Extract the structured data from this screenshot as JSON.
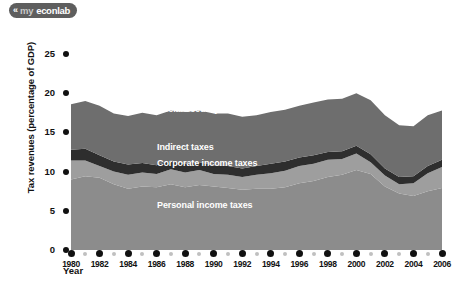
{
  "branding": {
    "logo_mark": "«",
    "logo_prefix": "my",
    "logo_suffix": "econlab"
  },
  "chart_data": {
    "type": "area",
    "title": "",
    "xlabel": "Year",
    "ylabel": "Tax revenues (percentage of GDP)",
    "xlim": [
      1980,
      2006
    ],
    "ylim": [
      0,
      25
    ],
    "yticks": [
      0,
      5,
      10,
      15,
      20,
      25
    ],
    "xticks": [
      1980,
      1982,
      1984,
      1986,
      1988,
      1990,
      1992,
      1994,
      1996,
      1998,
      2000,
      2002,
      2004,
      2006
    ],
    "grid": false,
    "legend_position": "inline-labels",
    "stacked": true,
    "x": [
      1980,
      1981,
      1982,
      1983,
      1984,
      1985,
      1986,
      1987,
      1988,
      1989,
      1990,
      1991,
      1992,
      1993,
      1994,
      1995,
      1996,
      1997,
      1998,
      1999,
      2000,
      2001,
      2002,
      2003,
      2004,
      2005,
      2006
    ],
    "series": [
      {
        "name": "Personal income taxes",
        "color": "#8c8c8c",
        "values": [
          9.0,
          9.4,
          9.2,
          8.4,
          7.8,
          8.1,
          8.0,
          8.4,
          8.0,
          8.3,
          8.1,
          7.9,
          7.7,
          7.8,
          7.8,
          8.0,
          8.5,
          8.8,
          9.3,
          9.6,
          10.2,
          9.7,
          8.1,
          7.2,
          6.9,
          7.5,
          7.9
        ]
      },
      {
        "name": "Corporate income taxes",
        "color": "#9e9e9e",
        "values": [
          2.4,
          2.0,
          1.5,
          1.6,
          1.8,
          1.8,
          1.7,
          1.9,
          1.9,
          1.9,
          1.6,
          1.7,
          1.6,
          1.8,
          2.0,
          2.1,
          2.2,
          2.2,
          2.2,
          2.0,
          2.1,
          1.5,
          1.4,
          1.2,
          1.6,
          2.3,
          2.7
        ]
      },
      {
        "name": "Indirect taxes",
        "color": "#2e2e2e",
        "values": [
          1.4,
          1.5,
          1.4,
          1.3,
          1.3,
          1.2,
          1.1,
          1.1,
          1.1,
          1.0,
          1.1,
          1.1,
          1.1,
          1.1,
          1.2,
          1.2,
          1.1,
          1.1,
          1.0,
          1.0,
          1.0,
          1.0,
          0.9,
          0.9,
          0.9,
          0.9,
          0.9
        ]
      },
      {
        "name": "Social security taxes",
        "color": "#6e6e6e",
        "values": [
          5.8,
          6.1,
          6.3,
          6.1,
          6.2,
          6.4,
          6.4,
          6.4,
          6.6,
          6.6,
          6.6,
          6.7,
          6.6,
          6.5,
          6.6,
          6.6,
          6.6,
          6.7,
          6.7,
          6.7,
          6.7,
          6.9,
          6.8,
          6.6,
          6.4,
          6.5,
          6.3
        ]
      }
    ],
    "totals": [
      18.6,
      19.0,
      18.4,
      17.4,
      17.1,
      17.5,
      17.2,
      17.8,
      17.6,
      17.8,
      17.4,
      17.4,
      17.0,
      17.2,
      17.6,
      17.9,
      18.4,
      18.8,
      19.2,
      19.3,
      20.0,
      19.1,
      17.2,
      15.9,
      15.8,
      17.2,
      17.8
    ],
    "area_labels": [
      {
        "text": "Social security taxes",
        "x": 157,
        "y": 82
      },
      {
        "text": "Indirect taxes",
        "x": 157,
        "y": 120
      },
      {
        "text": "Corporate income taxes",
        "x": 157,
        "y": 136
      },
      {
        "text": "Personal income taxes",
        "x": 157,
        "y": 178
      }
    ]
  }
}
